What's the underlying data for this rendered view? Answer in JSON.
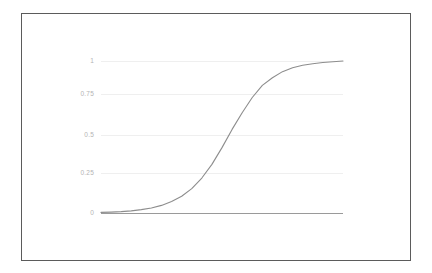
{
  "chart_data": {
    "type": "line",
    "title": "",
    "subtitle": "",
    "xlabel": "",
    "ylabel": "",
    "grid": true,
    "legend": false,
    "legend_position": "none",
    "xlim": [
      0,
      12
    ],
    "ylim": [
      0,
      1
    ],
    "y_ticks": [
      {
        "value": 1,
        "label": "1",
        "pixel_y": 47
      },
      {
        "value": 0.75,
        "label": "0.75",
        "pixel_y": 80
      },
      {
        "value": 0.5,
        "label": "0.5",
        "pixel_y": 121
      },
      {
        "value": 0.25,
        "label": "0.25",
        "pixel_y": 159
      },
      {
        "value": 0,
        "label": "0",
        "pixel_y": 199
      }
    ],
    "x_ticks": [],
    "x_tick_labels": [],
    "series": [
      {
        "name": "sigmoid",
        "color": "#8d8d8d",
        "x": [
          0.0,
          0.5,
          1.0,
          1.5,
          2.0,
          2.5,
          3.0,
          3.5,
          4.0,
          4.5,
          5.0,
          5.5,
          6.0,
          6.5,
          7.0,
          7.5,
          8.0,
          8.5,
          9.0,
          9.5,
          10.0,
          10.5,
          11.0,
          11.5,
          12.0
        ],
        "values": [
          0.004,
          0.006,
          0.009,
          0.014,
          0.022,
          0.033,
          0.05,
          0.075,
          0.11,
          0.16,
          0.23,
          0.32,
          0.43,
          0.55,
          0.66,
          0.76,
          0.84,
          0.89,
          0.93,
          0.955,
          0.972,
          0.982,
          0.99,
          0.995,
          1.0
        ]
      }
    ],
    "annotations": []
  },
  "chart": {
    "frame_color": "#5b5b5b",
    "gridline_color": "#efefef",
    "baseline_color": "#9a9a9a",
    "curve_color": "#8d8d8d",
    "label_color": "#b4b4b4",
    "background_color": "#ffffff"
  }
}
